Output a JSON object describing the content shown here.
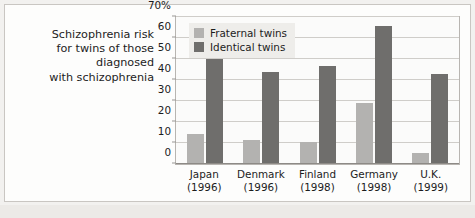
{
  "chart_data": {
    "type": "bar",
    "title": "Schizophrenia risk for twins of those diagnosed with schizophrenia",
    "title_lines": [
      "Schizophrenia risk",
      "for twins of those",
      "diagnosed",
      "with schizophrenia"
    ],
    "categories": [
      "Japan",
      "Denmark",
      "Finland",
      "Germany",
      "U.K."
    ],
    "category_years": [
      "(1996)",
      "(1996)",
      "(1998)",
      "(1998)",
      "(1999)"
    ],
    "series": [
      {
        "name": "Fraternal twins",
        "color": "#b3b2b0",
        "values": [
          14,
          11,
          10,
          29,
          5
        ]
      },
      {
        "name": "Identical twins",
        "color": "#6f6e6c",
        "values": [
          50,
          44,
          47,
          66,
          43
        ]
      }
    ],
    "xlabel": "",
    "ylabel": "",
    "ylim": [
      0,
      70
    ],
    "ytick_values": [
      0,
      10,
      20,
      30,
      40,
      50,
      60,
      70
    ],
    "ytick_labels": [
      "0",
      "10",
      "20",
      "30",
      "40",
      "50",
      "60",
      "70%"
    ],
    "grid": true,
    "legend_position": "top-left"
  }
}
